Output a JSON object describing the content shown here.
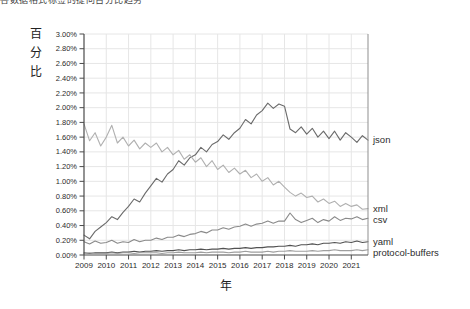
{
  "caption": {
    "text": "各数据格式标签的提问百分比趋势"
  },
  "chart_data": {
    "type": "line",
    "title": "",
    "xlabel": "年",
    "ylabel": "百分比",
    "grid": true,
    "legend_position": "right-end-labels",
    "xlim": [
      2009,
      2021.75
    ],
    "ylim": [
      0,
      3.0
    ],
    "x_start": 2009,
    "x_step": 0.25,
    "x_ticks": [
      "2009",
      "2010",
      "2011",
      "2012",
      "2013",
      "2014",
      "2015",
      "2016",
      "2017",
      "2018",
      "2019",
      "2020",
      "2021"
    ],
    "y_ticks": {
      "values": [
        0,
        0.2,
        0.4,
        0.6,
        0.8,
        1.0,
        1.2,
        1.4,
        1.6,
        1.8,
        2.0,
        2.2,
        2.4,
        2.6,
        2.8,
        3.0
      ],
      "labels": [
        "0.00%",
        "0.20%",
        "0.40%",
        "0.60%",
        "0.80%",
        "1.00%",
        "1.20%",
        "1.40%",
        "1.60%",
        "1.80%",
        "2.00%",
        "2.20%",
        "2.40%",
        "2.60%",
        "2.80%",
        "3.00%"
      ]
    },
    "colors": {
      "grid": "#e6e6e6",
      "axis": "#4a4a4a",
      "right_border": "#8f8f8f",
      "tick_text": "#2b2b2b"
    },
    "series": [
      {
        "name": "json",
        "color": "#6b6b6b",
        "values": [
          0.27,
          0.22,
          0.32,
          0.38,
          0.44,
          0.52,
          0.48,
          0.58,
          0.66,
          0.76,
          0.72,
          0.84,
          0.94,
          1.04,
          0.99,
          1.1,
          1.16,
          1.28,
          1.22,
          1.32,
          1.36,
          1.46,
          1.4,
          1.5,
          1.54,
          1.63,
          1.57,
          1.66,
          1.72,
          1.84,
          1.78,
          1.9,
          1.96,
          2.06,
          1.99,
          2.05,
          2.02,
          1.71,
          1.66,
          1.74,
          1.64,
          1.72,
          1.6,
          1.68,
          1.58,
          1.68,
          1.56,
          1.66,
          1.6,
          1.53,
          1.62,
          1.56
        ]
      },
      {
        "name": "xml",
        "color": "#b0b0b0",
        "values": [
          1.78,
          1.55,
          1.66,
          1.48,
          1.6,
          1.76,
          1.52,
          1.6,
          1.48,
          1.56,
          1.44,
          1.52,
          1.46,
          1.52,
          1.4,
          1.46,
          1.36,
          1.42,
          1.3,
          1.36,
          1.26,
          1.32,
          1.2,
          1.28,
          1.16,
          1.22,
          1.12,
          1.18,
          1.1,
          1.15,
          1.05,
          1.1,
          1.0,
          1.05,
          0.95,
          1.0,
          0.92,
          0.85,
          0.8,
          0.84,
          0.78,
          0.8,
          0.72,
          0.76,
          0.7,
          0.73,
          0.66,
          0.7,
          0.66,
          0.68,
          0.62,
          0.63
        ]
      },
      {
        "name": "csv",
        "color": "#8a8a8a",
        "values": [
          0.18,
          0.15,
          0.19,
          0.16,
          0.17,
          0.2,
          0.16,
          0.18,
          0.17,
          0.21,
          0.18,
          0.2,
          0.2,
          0.23,
          0.21,
          0.24,
          0.24,
          0.27,
          0.25,
          0.28,
          0.29,
          0.32,
          0.3,
          0.34,
          0.34,
          0.37,
          0.35,
          0.38,
          0.39,
          0.42,
          0.39,
          0.42,
          0.43,
          0.46,
          0.43,
          0.46,
          0.46,
          0.57,
          0.48,
          0.44,
          0.47,
          0.5,
          0.44,
          0.48,
          0.46,
          0.52,
          0.47,
          0.5,
          0.49,
          0.52,
          0.48,
          0.5
        ]
      },
      {
        "name": "yaml",
        "color": "#525252",
        "values": [
          0.03,
          0.02,
          0.03,
          0.03,
          0.03,
          0.04,
          0.03,
          0.04,
          0.04,
          0.05,
          0.04,
          0.05,
          0.05,
          0.06,
          0.05,
          0.06,
          0.06,
          0.07,
          0.06,
          0.07,
          0.07,
          0.08,
          0.07,
          0.08,
          0.08,
          0.09,
          0.08,
          0.09,
          0.09,
          0.1,
          0.09,
          0.1,
          0.1,
          0.11,
          0.11,
          0.12,
          0.12,
          0.13,
          0.12,
          0.14,
          0.14,
          0.15,
          0.14,
          0.16,
          0.16,
          0.17,
          0.16,
          0.18,
          0.17,
          0.19,
          0.17,
          0.18
        ]
      },
      {
        "name": "protocol-buffers",
        "color": "#9e9e9e",
        "values": [
          0.02,
          0.03,
          0.02,
          0.02,
          0.02,
          0.03,
          0.02,
          0.03,
          0.03,
          0.02,
          0.03,
          0.03,
          0.03,
          0.03,
          0.02,
          0.03,
          0.03,
          0.04,
          0.03,
          0.03,
          0.03,
          0.04,
          0.03,
          0.04,
          0.04,
          0.04,
          0.03,
          0.04,
          0.04,
          0.05,
          0.04,
          0.04,
          0.04,
          0.05,
          0.04,
          0.05,
          0.05,
          0.06,
          0.05,
          0.05,
          0.05,
          0.06,
          0.05,
          0.06,
          0.06,
          0.07,
          0.06,
          0.06,
          0.06,
          0.07,
          0.06,
          0.07
        ]
      }
    ]
  }
}
